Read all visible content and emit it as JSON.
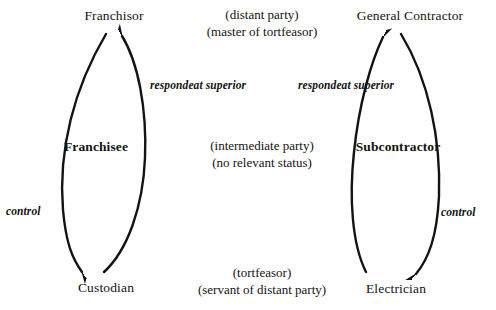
{
  "diagram": {
    "ink_color": "#131313",
    "background": "#ffffff",
    "left_chain": {
      "top_node": "Franchisor",
      "middle_node": "Franchisee",
      "bottom_node": "Custodian",
      "upward_edge_label_line1": "respondeat",
      "upward_edge_label_line2": "superior",
      "downward_edge_label": "control"
    },
    "right_chain": {
      "top_node": "General Contractor",
      "middle_node": "Subcontractor",
      "bottom_node": "Electrician",
      "upward_edge_label_line1": "respondeat",
      "upward_edge_label_line2": "superior",
      "downward_edge_label": "control"
    },
    "center_statuses": {
      "top_line1": "(distant party)",
      "top_line2": "(master of tortfeasor)",
      "middle_line1": "(intermediate party)",
      "middle_line2": "(no relevant status)",
      "bottom_line1": "(tortfeasor)",
      "bottom_line2": "(servant of distant party)"
    }
  }
}
